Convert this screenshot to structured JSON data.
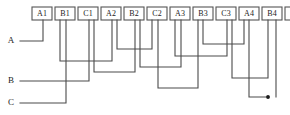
{
  "diagram": {
    "canvas": {
      "width": 290,
      "height": 115,
      "background": "#ffffff"
    },
    "stroke_color": "#4a4a4a",
    "box_stroke_color": "#555555",
    "text_color": "#1c1c1c",
    "boxes": [
      {
        "label": "A1",
        "x": 32,
        "y": 7,
        "w": 20,
        "h": 13
      },
      {
        "label": "B1",
        "x": 55,
        "y": 7,
        "w": 20,
        "h": 13
      },
      {
        "label": "C1",
        "x": 78,
        "y": 7,
        "w": 20,
        "h": 13
      },
      {
        "label": "A2",
        "x": 101,
        "y": 7,
        "w": 20,
        "h": 13
      },
      {
        "label": "B2",
        "x": 124,
        "y": 7,
        "w": 20,
        "h": 13
      },
      {
        "label": "C2",
        "x": 147,
        "y": 7,
        "w": 20,
        "h": 13
      },
      {
        "label": "A3",
        "x": 170,
        "y": 7,
        "w": 20,
        "h": 13
      },
      {
        "label": "B3",
        "x": 193,
        "y": 7,
        "w": 20,
        "h": 13
      },
      {
        "label": "C3",
        "x": 216,
        "y": 7,
        "w": 20,
        "h": 13
      },
      {
        "label": "A4",
        "x": 239,
        "y": 7,
        "w": 20,
        "h": 13
      },
      {
        "label": "B4",
        "x": 262,
        "y": 7,
        "w": 20,
        "h": 13
      },
      {
        "label": "C4",
        "x": 285,
        "y": 7,
        "w": 20,
        "h": 13
      }
    ],
    "phase_labels": [
      {
        "name": "A",
        "text": "A",
        "x": 11,
        "y": 41
      },
      {
        "name": "B",
        "text": "B",
        "x": 11,
        "y": 81
      },
      {
        "name": "C",
        "text": "C",
        "x": 11,
        "y": 103
      }
    ],
    "phase_lead_lines": [
      {
        "name": "lead-a",
        "d": "M 20 41 L 43 41 L 43 20"
      },
      {
        "name": "lead-b",
        "d": "M 20 81 L 89 81 L 89 20"
      },
      {
        "name": "lead-c",
        "d": "M 20 103 L 66 103 L 66 20"
      }
    ],
    "wires": [
      {
        "name": "wire-b1-to-a2",
        "d": "M 60 20 L 60 61 L 112 61 L 112 20"
      },
      {
        "name": "wire-c1-to-b2",
        "d": "M 94 20 L 94 72 L 135 72 L 135 20"
      },
      {
        "name": "wire-a2-to-c2",
        "d": "M 117 20 L 117 49 L 152 49 L 152 20"
      },
      {
        "name": "wire-b2-to-a3",
        "d": "M 140 20 L 140 67 L 181 67 L 181 20"
      },
      {
        "name": "wire-c2-to-b3",
        "d": "M 158 20 L 158 88 L 198 88 L 198 20"
      },
      {
        "name": "wire-a3-to-c3",
        "d": "M 175 20 L 175 56 L 227 56 L 227 20"
      },
      {
        "name": "wire-b3-to-a4",
        "d": "M 203 20 L 203 44 L 244 44 L 244 20"
      },
      {
        "name": "wire-c3-to-b4",
        "d": "M 232 20 L 232 78 L 268 78 L 268 20"
      },
      {
        "name": "wire-a4-to-junction",
        "d": "M 249 20 L 249 97 L 269 97"
      },
      {
        "name": "wire-c4-to-junction",
        "d": "M 276 20 L 276 97"
      }
    ],
    "junctions": [
      {
        "name": "junction-right",
        "x": 268,
        "y": 97,
        "r": 1.9
      }
    ]
  }
}
